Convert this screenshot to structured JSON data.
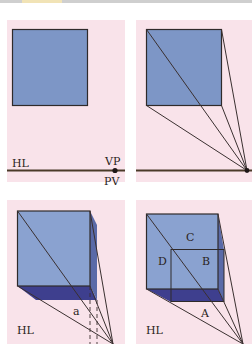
{
  "figure": {
    "colors": {
      "panel_bg": "#f9e3ea",
      "square_fill": "#7d96c6",
      "square_fill_light": "#8aa2d0",
      "dark_face": "#3e3f8e",
      "side_face": "#5a6aa8",
      "line": "#3a3030",
      "horizon_line": "#4a3a28"
    },
    "panels": [
      {
        "id": "panel-1",
        "labels": {
          "horizon": "HL",
          "vanishing_point": "VP",
          "point_of_view": "PV"
        }
      },
      {
        "id": "panel-2",
        "labels": {}
      },
      {
        "id": "panel-3",
        "labels": {
          "horizon": "HL",
          "depth": "a"
        }
      },
      {
        "id": "panel-4",
        "labels": {
          "horizon": "HL",
          "a": "A",
          "b": "B",
          "c": "C",
          "d": "D"
        }
      }
    ]
  }
}
